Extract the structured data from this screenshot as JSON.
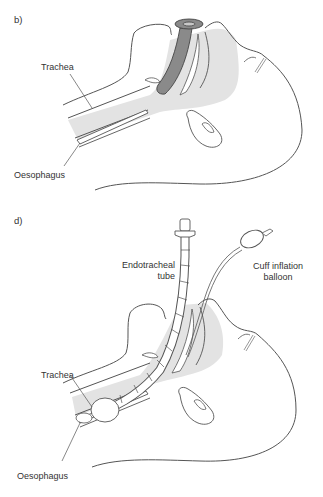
{
  "figure": {
    "colors": {
      "line": "#555555",
      "airway_fill": "#e3e3e3",
      "tube_fill_b": "#8a8a8a",
      "background": "#ffffff"
    },
    "panels": [
      {
        "id": "b",
        "letter": "b)",
        "labels": {
          "trachea": "Trachea",
          "oesophagus": "Oesophagus"
        }
      },
      {
        "id": "d",
        "letter": "d)",
        "labels": {
          "tube_line1": "Endotracheal",
          "tube_line2": "tube",
          "balloon_line1": "Cuff inflation",
          "balloon_line2": "balloon",
          "trachea": "Trachea",
          "oesophagus": "Oesophagus"
        }
      }
    ]
  }
}
